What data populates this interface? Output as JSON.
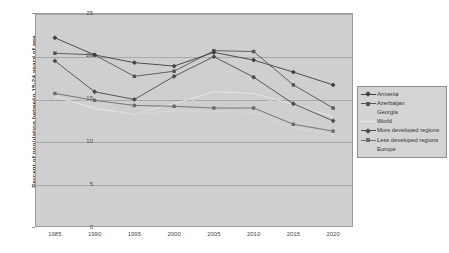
{
  "chart_data": {
    "type": "line",
    "title": "",
    "xlabel": "",
    "ylabel": "Percent of population between 15-24 years of age",
    "x": [
      1985,
      1990,
      1995,
      2000,
      2005,
      2010,
      2015,
      2020
    ],
    "xticklabels": [
      "1985",
      "1990",
      "1995",
      "2000",
      "2005",
      "2010",
      "2015",
      "2020"
    ],
    "yticklabels": [
      "0",
      "5",
      "10",
      "15",
      "20",
      "25"
    ],
    "ylim": [
      0,
      25
    ],
    "ytick_step": 5,
    "grid": true,
    "legend_position": "right",
    "series": [
      {
        "name": "Armenia",
        "color": "#3f3f3f",
        "marker": "diamond",
        "values": [
          22.1,
          20.1,
          19.2,
          18.8,
          20.4,
          19.5,
          18.1,
          16.6
        ]
      },
      {
        "name": "Azerbaijan",
        "color": "#545454",
        "marker": "square",
        "values": [
          20.3,
          20.1,
          17.6,
          18.2,
          20.6,
          20.5,
          16.6,
          13.9
        ]
      },
      {
        "name": "Georgia",
        "color": "#cfcfcf",
        "marker": "none",
        "values": [
          15.9,
          14.3,
          13.3,
          14.0,
          15.6,
          15.2,
          14.2,
          13.2
        ]
      },
      {
        "name": "World",
        "color": "#e8e8e8",
        "marker": "none",
        "values": [
          15.3,
          13.8,
          13.2,
          14.4,
          15.8,
          15.6,
          14.3,
          12.9
        ]
      },
      {
        "name": "More developed regions",
        "color": "#4a4a4a",
        "marker": "diamond",
        "values": [
          19.4,
          15.8,
          14.9,
          17.6,
          19.9,
          17.5,
          14.4,
          12.4
        ]
      },
      {
        "name": "Less developed regions",
        "color": "#6b6b6b",
        "marker": "square",
        "values": [
          15.6,
          14.8,
          14.2,
          14.1,
          13.9,
          13.9,
          12.0,
          11.2
        ]
      },
      {
        "name": "Europe",
        "color": "#d8d8d8",
        "marker": "triangle",
        "values": [
          15.2,
          14.0,
          13.2,
          13.6,
          13.5,
          13.4,
          11.6,
          10.8
        ]
      }
    ]
  }
}
